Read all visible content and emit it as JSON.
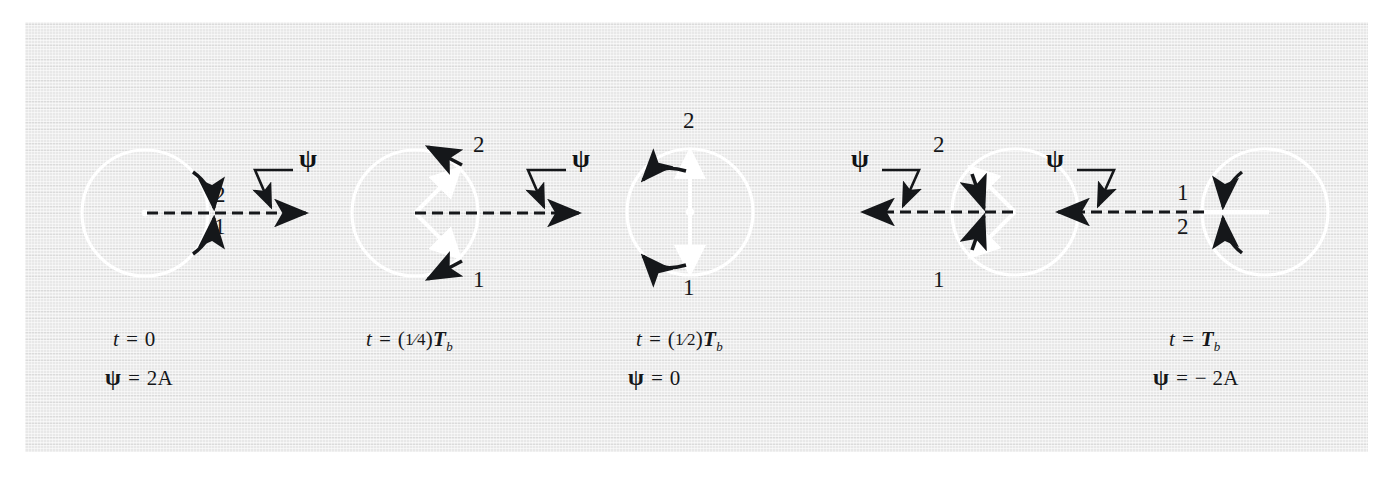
{
  "figure": {
    "background_color": "#e8e8e8",
    "phasor_color": "#ffffff",
    "ink_color": "#15171a",
    "page_background": "#ffffff"
  },
  "panels": [
    {
      "id": "panel-1",
      "time_label": "t = 0",
      "time_value": "0",
      "resultant_label": "ψ = 2A",
      "resultant_value": "2A",
      "psi_symbol": "ψ",
      "phasor_labels": {
        "upper": "2",
        "lower": "1"
      },
      "phasor_angles_deg": [
        0,
        0
      ],
      "resultant_direction": "right",
      "caption_lines": [
        "t = 0",
        "ψ = 2A"
      ]
    },
    {
      "id": "panel-2",
      "time_label": "t = (1/4)Tb",
      "time_value": "(¼)T",
      "time_subscript": "b",
      "resultant_label": "",
      "psi_symbol": "ψ",
      "phasor_labels": {
        "upper": "2",
        "lower": "1"
      },
      "phasor_angles_deg": [
        45,
        -45
      ],
      "resultant_direction": "right",
      "caption_lines": [
        "t = (¼)Tb"
      ]
    },
    {
      "id": "panel-3",
      "time_label": "t = (1/2)Tb",
      "time_value": "(½)T",
      "time_subscript": "b",
      "resultant_label": "ψ = 0",
      "resultant_value": "0",
      "psi_symbol": "ψ",
      "phasor_labels": {
        "upper": "2",
        "lower": "1"
      },
      "phasor_angles_deg": [
        90,
        -90
      ],
      "resultant_direction": "none",
      "caption_lines": [
        "t = (½)Tb",
        "ψ = 0"
      ]
    },
    {
      "id": "panel-4",
      "time_label": "",
      "resultant_label": "",
      "psi_symbol": "ψ",
      "phasor_labels": {
        "upper": "2",
        "lower": "1"
      },
      "phasor_angles_deg": [
        135,
        -135
      ],
      "resultant_direction": "left",
      "caption_lines": []
    },
    {
      "id": "panel-5",
      "time_label": "t = Tb",
      "time_value": "T",
      "time_subscript": "b",
      "resultant_label": "ψ = − 2A",
      "resultant_value": "− 2A",
      "psi_symbol": "ψ",
      "phasor_labels": {
        "upper": "1",
        "lower": "2"
      },
      "phasor_angles_deg": [
        180,
        180
      ],
      "resultant_direction": "left",
      "caption_lines": [
        "t = Tb",
        "ψ = − 2A"
      ]
    }
  ],
  "captions": {
    "t_equals": "t =",
    "psi_equals": "=",
    "panel1_time": "0",
    "panel1_psi": "2A",
    "panel2_time_frac_num": "1",
    "panel2_time_frac_den": "4",
    "panel2_time_T": "T",
    "panel2_time_sub": "b",
    "panel3_time_frac_num": "1",
    "panel3_time_frac_den": "2",
    "panel3_time_T": "T",
    "panel3_time_sub": "b",
    "panel3_psi": "0",
    "panel5_time_T": "T",
    "panel5_time_sub": "b",
    "panel5_psi": "− 2A",
    "psi_glyph": "ψ"
  },
  "labels": {
    "two": "2",
    "one": "1",
    "psi": "ψ"
  }
}
